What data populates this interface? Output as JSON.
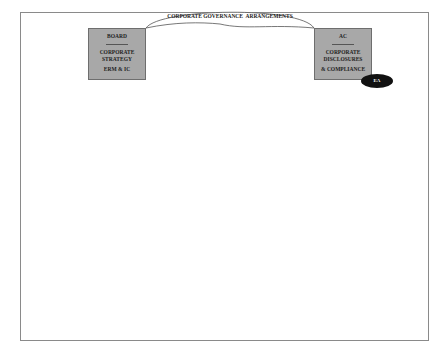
{
  "diagram": {
    "arc_label": "CORPORATE GOVERNANCE  ARRANGEMENTS",
    "left_box": {
      "title": "BOARD",
      "separator": "------------------",
      "line1": "CORPORATE",
      "line2": "STRATEGY",
      "line3": "ERM & IC"
    },
    "right_box": {
      "title": "AC",
      "separator": "------------------",
      "line1": "CORPORATE",
      "line2": "DISCLOSURES",
      "line3": "& COMPLIANCE"
    },
    "ellipse_label": "EA",
    "colors": {
      "box_fill": "#a8a8a8",
      "ellipse_fill": "#111111",
      "frame_border": "#8a8a8a"
    }
  }
}
